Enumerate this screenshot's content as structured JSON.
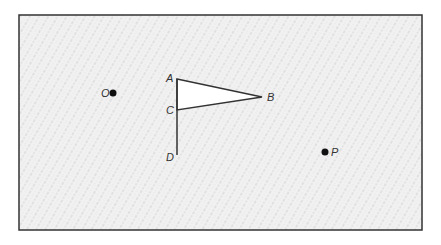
{
  "diagram": {
    "frame": {
      "x": 19,
      "y": 15,
      "width": 403,
      "height": 215,
      "stroke": "#333333",
      "fill": "#efefef"
    },
    "points": [
      {
        "id": "O",
        "label": "O",
        "x": 113,
        "y": 93,
        "dot": true,
        "label_dx": -12,
        "label_dy": 4
      },
      {
        "id": "P",
        "label": "P",
        "x": 325,
        "y": 152,
        "dot": true,
        "label_dx": 6,
        "label_dy": 4
      },
      {
        "id": "A",
        "label": "A",
        "x": 177,
        "y": 79,
        "dot": false,
        "label_dx": -11,
        "label_dy": 3
      },
      {
        "id": "B",
        "label": "B",
        "x": 262,
        "y": 97,
        "dot": false,
        "label_dx": 5,
        "label_dy": 4
      },
      {
        "id": "C",
        "label": "C",
        "x": 177,
        "y": 110,
        "dot": false,
        "label_dx": -11,
        "label_dy": 4
      },
      {
        "id": "D",
        "label": "D",
        "x": 177,
        "y": 155,
        "dot": false,
        "label_dx": -11,
        "label_dy": 6
      }
    ],
    "flag": {
      "triangle": [
        "A",
        "B",
        "C"
      ],
      "pole": [
        "A",
        "D"
      ],
      "triangle_fill": "#ffffff"
    },
    "labels": {
      "O": "O",
      "P": "P",
      "A": "A",
      "B": "B",
      "C": "C",
      "D": "D"
    }
  }
}
